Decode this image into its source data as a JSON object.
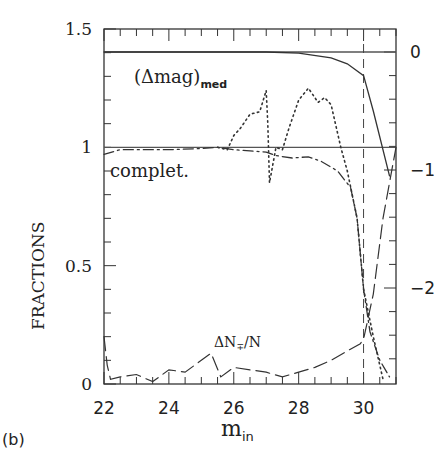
{
  "chart_data": {
    "type": "line",
    "panel_label": "(b)",
    "xlabel": "m_in",
    "ylabel": "FRACTIONS",
    "ylabel_right": "",
    "xlim": [
      22,
      31
    ],
    "ylim": [
      0,
      1.5
    ],
    "ylim_right": [
      -2.8,
      0.2
    ],
    "x_ticks": [
      "22",
      "24",
      "26",
      "28",
      "30"
    ],
    "y_ticks": [
      "0",
      "0.5",
      "1",
      "1.5"
    ],
    "y_ticks_right": [
      "0",
      "-1",
      "-2"
    ],
    "reference_lines": [
      {
        "axis": "y",
        "value": 1.0,
        "style": "solid"
      },
      {
        "axis": "y_right",
        "value": 0,
        "style": "solid"
      },
      {
        "axis": "x",
        "value": 30,
        "style": "dashed"
      }
    ],
    "annotations": [
      "(Δmag)med",
      "complet.",
      "ΔN∓/N"
    ],
    "series": [
      {
        "name": "(Δmag)med",
        "axis": "right",
        "style": "solid",
        "x": [
          22,
          26,
          27,
          28,
          29,
          29.5,
          30,
          30.3,
          30.8
        ],
        "y": [
          0,
          0,
          0,
          -0.01,
          -0.05,
          -0.1,
          -0.2,
          -0.5,
          -1.05
        ]
      },
      {
        "name": "complet.",
        "axis": "left",
        "style": "dash-dot",
        "x": [
          22,
          22.5,
          23,
          24,
          25,
          25.5,
          26,
          26.5,
          27,
          27.3,
          27.8,
          28.3,
          28.7,
          29.2,
          29.6,
          29.8,
          30,
          30.2,
          30.5,
          30.8
        ],
        "y": [
          0.97,
          0.99,
          0.99,
          0.99,
          0.995,
          1.0,
          0.99,
          0.985,
          0.98,
          0.965,
          0.955,
          0.96,
          0.94,
          0.9,
          0.83,
          0.7,
          0.4,
          0.22,
          0.1,
          0.03
        ]
      },
      {
        "name": "false/true ratio (dotted)",
        "axis": "left",
        "style": "dotted",
        "x": [
          25.5,
          25.8,
          26,
          26.2,
          26.5,
          26.8,
          27,
          27.05,
          27.1,
          27.3,
          27.5,
          27.7,
          28,
          28.3,
          28.6,
          28.8,
          29,
          29.3,
          29.5,
          29.8,
          30,
          30.3,
          30.6
        ],
        "y": [
          1.0,
          0.99,
          1.05,
          1.08,
          1.14,
          1.15,
          1.24,
          1.1,
          0.85,
          1.0,
          0.99,
          1.08,
          1.2,
          1.25,
          1.19,
          1.21,
          1.18,
          1.0,
          0.9,
          0.7,
          0.4,
          0.2,
          0.02
        ]
      },
      {
        "name": "ΔN∓/N",
        "axis": "left",
        "style": "long-dash",
        "x": [
          22,
          22.1,
          22.2,
          22.5,
          23,
          23.5,
          24,
          24.5,
          25,
          25.3,
          25.6,
          26,
          26.5,
          27,
          27.5,
          28,
          28.5,
          29,
          29.5,
          29.9,
          30,
          30.3,
          30.6,
          31
        ],
        "y": [
          0.2,
          0.08,
          0.02,
          0.03,
          0.04,
          0.01,
          0.06,
          0.05,
          0.1,
          0.13,
          0.03,
          0.07,
          0.06,
          0.05,
          0.03,
          0.05,
          0.07,
          0.1,
          0.14,
          0.17,
          0.19,
          0.38,
          0.7,
          1.0
        ]
      }
    ]
  }
}
